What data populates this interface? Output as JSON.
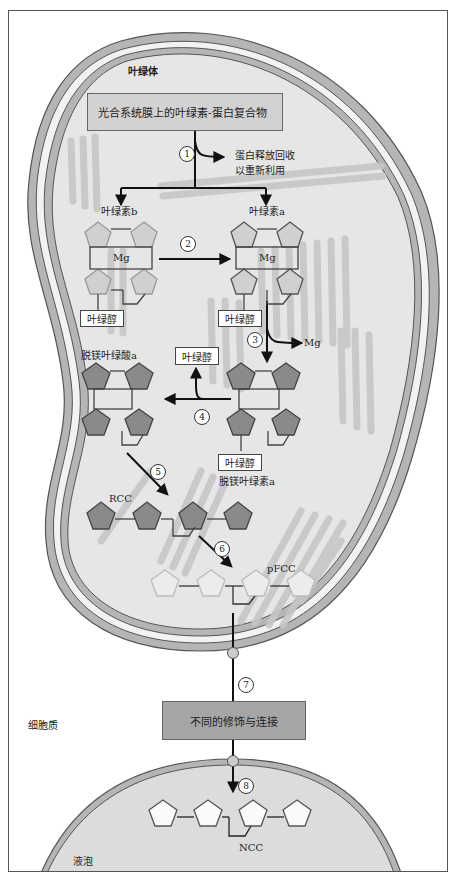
{
  "diagram": {
    "title_region_chloroplast": "叶绿体",
    "region_cytoplasm": "细胞质",
    "region_vacuole": "液泡",
    "complex_box": "光合系统膜上的叶绿素-蛋白复合物",
    "protein_release": [
      "蛋白释放回收",
      "以重新利用"
    ],
    "chlorophyll_b": "叶绿素b",
    "chlorophyll_a": "叶绿素a",
    "mg_label": "Mg",
    "phytol": "叶绿醇",
    "mg_released": "Mg",
    "pheophorbide_a": "脱镁叶绿酸a",
    "pheophytin_a": "脱镁叶绿素a",
    "rcc": "RCC",
    "pfcc": "pFCC",
    "ncc": "NCC",
    "modification_box": "不同的修饰与连接",
    "steps": [
      "1",
      "2",
      "3",
      "4",
      "5",
      "6",
      "7",
      "8"
    ]
  },
  "colors": {
    "chloroplast_fill": "#e6e6e6",
    "membrane_gray": "#b5b5b5",
    "membrane_line": "#555555",
    "thylakoid": "#c8c8c8",
    "box_fill": "#d2d2d2",
    "mod_box_fill": "#a6a6a6",
    "pentagon_light": "#d0d0d0",
    "pentagon_dark": "#8a8a8a",
    "pentagon_pale": "#ececec",
    "vacuole_fill": "#dcdcdc"
  }
}
